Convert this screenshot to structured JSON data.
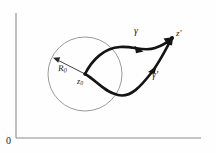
{
  "figure": {
    "background_color": "#fefefe",
    "axis_color": "#8a8a8a",
    "circle_color": "#9a9a9a",
    "curve_color": "#141414",
    "label_color": "#1a1a1a"
  },
  "axes": {
    "origin_label": "0",
    "vertical": {
      "x": 16,
      "y_top": 13,
      "y_bottom": 138
    },
    "horizontal": {
      "y": 138,
      "x_left": 16,
      "x_right": 201
    }
  },
  "circle": {
    "center_x": 85,
    "center_y": 74,
    "radius": 37,
    "center_label": "z",
    "center_label_subscript": "0",
    "radius_label": "R",
    "radius_label_subscript": "0",
    "radius_arrow_from_x": 85,
    "radius_arrow_from_y": 74,
    "radius_arrow_to_x": 54,
    "radius_arrow_to_y": 58
  },
  "curves": [
    {
      "name": "gamma-upper",
      "label": "γ",
      "label_x": 134,
      "label_y": 26,
      "start_x": 85,
      "start_y": 74,
      "end_x": 172,
      "end_y": 38,
      "arrow_count": 2
    },
    {
      "name": "gamma-prime-lower",
      "label": "γ′",
      "label_x": 152,
      "label_y": 70,
      "start_x": 85,
      "start_y": 74,
      "end_x": 172,
      "end_y": 38,
      "arrow_count": 2
    }
  ],
  "endpoint": {
    "label": "z",
    "label_prime": "′",
    "x": 172,
    "y": 38
  }
}
